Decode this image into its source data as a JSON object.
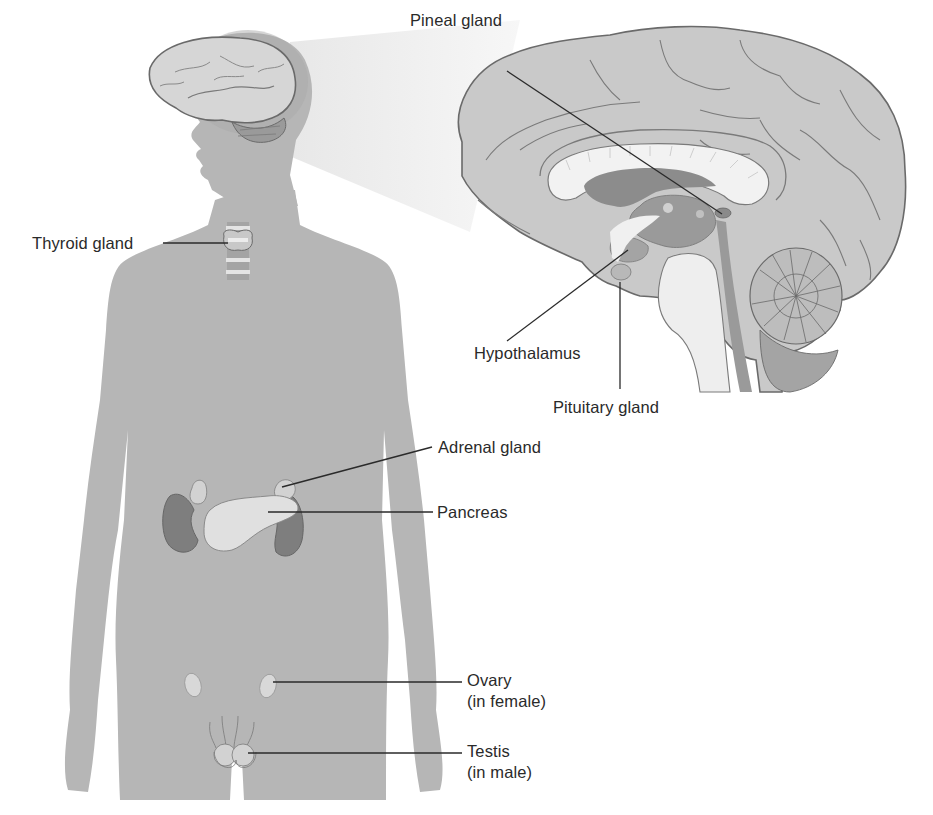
{
  "figure": {
    "colors": {
      "background": "#ffffff",
      "body_silhouette": "#b6b6b6",
      "projection_cone": "#ececec",
      "brain_cortex": "#c9c9c9",
      "brain_outline": "#6a6a6a",
      "corpus_callosum": "#f2f2f2",
      "dark_structures": "#8c8c8c",
      "kidney": "#7a7a7a",
      "gland_highlight": "#dedede",
      "leader_line": "#2a2a2a",
      "label_text": "#2a2a2a"
    }
  },
  "labels": {
    "pineal": "Pineal gland",
    "thyroid": "Thyroid gland",
    "hypothalamus": "Hypothalamus",
    "pituitary": "Pituitary gland",
    "adrenal": "Adrenal gland",
    "pancreas": "Pancreas",
    "ovary": {
      "line1": "Ovary",
      "line2": "(in female)"
    },
    "testis": {
      "line1": "Testis",
      "line2": "(in male)"
    }
  }
}
